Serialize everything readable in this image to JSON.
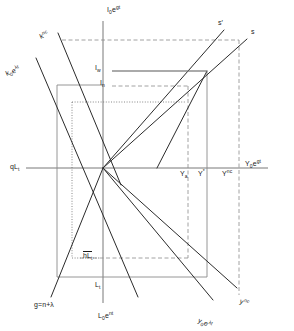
{
  "figure": {
    "style": {
      "line_color": "#333333",
      "axis_color": "#555555",
      "background": "#ffffff"
    }
  },
  "axes": {
    "vertical_top_label": "I₀e^gt",
    "vertical_bottom_label": "L₀e^nt",
    "horizontal_left_label": "qLₜ",
    "horizontal_right_label": "Y₀e^gt",
    "origin": {
      "x": 103,
      "y": 168
    }
  },
  "curves": [
    {
      "name": "k-nc",
      "label": "k^nc",
      "label_x": 41,
      "label_y": 29
    },
    {
      "name": "k0-e-lambda",
      "label": "k₀e^λt",
      "label_x": 9,
      "label_y": 66
    },
    {
      "name": "s-prime",
      "label": "s'",
      "label_x": 219,
      "label_y": 24
    },
    {
      "name": "s",
      "label": "s",
      "label_x": 250,
      "label_y": 33
    },
    {
      "name": "g-line",
      "label": "g=n+λ",
      "label_x": 38,
      "label_y": 307
    },
    {
      "name": "y-nc",
      "label": "y^nc",
      "label_x": 240,
      "label_y": 291
    },
    {
      "name": "y0-e-lambda",
      "label": "y₀e^λt",
      "label_x": 200,
      "label_y": 310
    }
  ],
  "markers": {
    "investment_w": "Iᵥᵥ",
    "investment_w_text": "I",
    "investment_w_sub": "w",
    "investment_n_text": "I",
    "investment_n_sub": "n",
    "output_a_text": "Y",
    "output_a_sub": "a",
    "output_star_text": "Y",
    "output_star_sup": "*",
    "output_nc_text": "Y",
    "output_nc_sup": "nc",
    "labour_t_text": "L",
    "labour_t_sub": "t",
    "hbar_l_text": "hL",
    "hbar_l_sub": "t"
  },
  "labels": {
    "I_w": "Iᵥ",
    "I_n": "Iₙ",
    "Y_a": "Yₐ",
    "Y_star": "Y*",
    "Y_nc": "Yⁿᶜ",
    "L_t": "Lₜ",
    "hL_t": "hLₜ"
  },
  "gridlines": {
    "dashed_top_y": 40,
    "dashed_I_n_y": 86,
    "dotted_y": 102,
    "box_left_x": 57,
    "box_right_x": 207,
    "box_top_y": 85,
    "box_bottom_y": 277,
    "dashed_right_x": 239,
    "dashed_Ya_x": 188,
    "dotted_left_x": 72
  }
}
